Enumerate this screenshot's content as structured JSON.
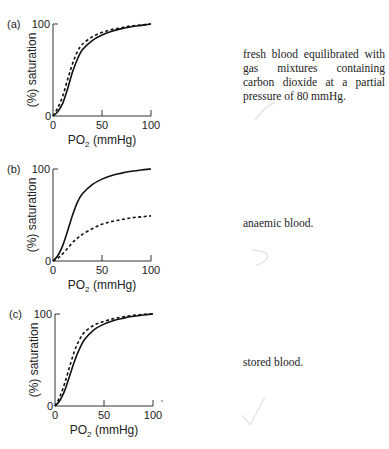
{
  "chart_data": [
    {
      "type": "line",
      "panel": "(a)",
      "xlabel": "PO2 (mmHg)",
      "ylabel": "(%) saturation",
      "xlim": [
        0,
        100
      ],
      "ylim": [
        0,
        100
      ],
      "xticks": [
        "0",
        "50",
        "100"
      ],
      "yticks": [
        "0",
        "100"
      ],
      "caption": "fresh blood equilibrated with gas mixtures containing carbon dioxide at a partial pressure of 80 mmHg.",
      "series": [
        {
          "name": "normal",
          "style": "solid",
          "x": [
            0,
            5,
            10,
            15,
            20,
            25,
            30,
            40,
            50,
            60,
            70,
            80,
            90,
            100
          ],
          "y": [
            0,
            5,
            14,
            30,
            48,
            62,
            72,
            82,
            88,
            92,
            95,
            97,
            98.5,
            100
          ]
        },
        {
          "name": "condition",
          "style": "dashed",
          "x": [
            0,
            5,
            10,
            15,
            20,
            25,
            30,
            40,
            50,
            60,
            70,
            80,
            90,
            100
          ],
          "y": [
            0,
            9,
            22,
            40,
            57,
            70,
            78,
            86,
            91,
            94,
            96,
            98,
            99,
            100
          ]
        }
      ]
    },
    {
      "type": "line",
      "panel": "(b)",
      "xlabel": "PO2 (mmHg)",
      "ylabel": "(%) saturation",
      "xlim": [
        0,
        100
      ],
      "ylim": [
        0,
        100
      ],
      "xticks": [
        "0",
        "50",
        "100"
      ],
      "yticks": [
        "0",
        "100"
      ],
      "caption": "anaemic blood.",
      "series": [
        {
          "name": "normal",
          "style": "solid",
          "x": [
            0,
            5,
            10,
            15,
            20,
            25,
            30,
            40,
            50,
            60,
            70,
            80,
            90,
            100
          ],
          "y": [
            0,
            6,
            17,
            33,
            50,
            64,
            73,
            83,
            89,
            93,
            95.5,
            97.5,
            99,
            100
          ]
        },
        {
          "name": "condition",
          "style": "dashed",
          "x": [
            0,
            5,
            10,
            15,
            20,
            25,
            30,
            40,
            50,
            60,
            70,
            80,
            90,
            100
          ],
          "y": [
            0,
            3,
            8,
            14,
            20,
            25,
            29,
            35,
            40,
            43,
            45,
            47,
            48,
            49
          ]
        }
      ]
    },
    {
      "type": "line",
      "panel": "(c)",
      "xlabel": "PO2 (mmHg)",
      "ylabel": "(%) saturation",
      "xlim": [
        0,
        100
      ],
      "ylim": [
        0,
        100
      ],
      "xticks": [
        "0",
        "50",
        "100"
      ],
      "yticks": [
        "0",
        "100"
      ],
      "caption": "stored blood.",
      "series": [
        {
          "name": "normal",
          "style": "solid",
          "x": [
            0,
            5,
            10,
            15,
            20,
            25,
            30,
            40,
            50,
            60,
            70,
            80,
            90,
            100
          ],
          "y": [
            0,
            6,
            17,
            33,
            49,
            62,
            72,
            83,
            89,
            93,
            95.5,
            97.5,
            99,
            100
          ]
        },
        {
          "name": "condition",
          "style": "dashed",
          "x": [
            0,
            5,
            10,
            15,
            20,
            25,
            30,
            40,
            50,
            60,
            70,
            80,
            90,
            100
          ],
          "y": [
            0,
            10,
            25,
            43,
            60,
            72,
            80,
            88,
            92,
            95,
            97,
            98.5,
            99.5,
            100
          ]
        }
      ]
    }
  ]
}
